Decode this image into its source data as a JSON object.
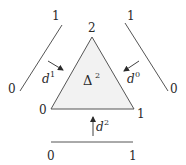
{
  "diagram": {
    "simplex": {
      "label": "Δ",
      "label_sup": "2",
      "fill": "#f2f2f2",
      "stroke": "#555555",
      "vertices": {
        "top": "2",
        "bottom_left": "0",
        "bottom_right": "1"
      }
    },
    "left_edge": {
      "start_label": "0",
      "end_label": "1",
      "map_label": "d",
      "map_sup": "1"
    },
    "right_edge": {
      "start_label": "0",
      "end_label": "1",
      "map_label": "d",
      "map_sup": "0"
    },
    "bottom_edge": {
      "start_label": "0",
      "end_label": "1",
      "map_label": "d",
      "map_sup": "2"
    },
    "colors": {
      "line": "#555555",
      "text": "#2a2a2a",
      "fill": "#f2f2f2"
    }
  }
}
